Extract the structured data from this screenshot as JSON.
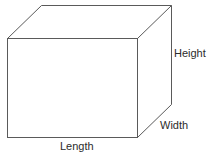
{
  "diagram": {
    "line_color": "#5a5a5a",
    "labels": {
      "height": "Height",
      "width": "Width",
      "length": "Length"
    },
    "box": {
      "front": {
        "x1": 7,
        "y1": 38,
        "x2": 137,
        "y2": 137
      },
      "depth_offset": {
        "dx": 34,
        "dy": -33
      }
    }
  }
}
